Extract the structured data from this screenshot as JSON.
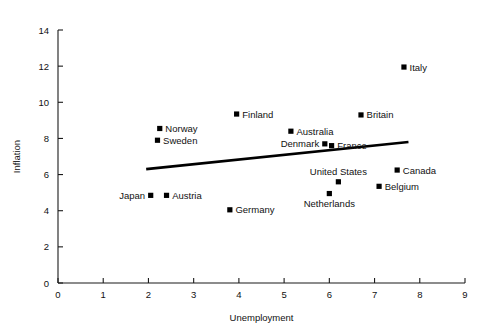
{
  "chart_data": {
    "type": "scatter",
    "title": "",
    "xlabel": "Unemployment",
    "ylabel": "Inflation",
    "xlim": [
      0,
      9
    ],
    "ylim": [
      0,
      14
    ],
    "xticks": [
      0,
      1,
      2,
      3,
      4,
      5,
      6,
      7,
      8,
      9
    ],
    "yticks": [
      0,
      2,
      4,
      6,
      8,
      10,
      12,
      14
    ],
    "grid": false,
    "legend": "none",
    "marker_style": "filled-square",
    "marker_color": "#000000",
    "points": [
      {
        "label": "Italy",
        "x": 7.65,
        "y": 11.95,
        "label_pos": "right"
      },
      {
        "label": "Britain",
        "x": 6.7,
        "y": 9.3,
        "label_pos": "right"
      },
      {
        "label": "Finland",
        "x": 3.95,
        "y": 9.35,
        "label_pos": "right"
      },
      {
        "label": "Norway",
        "x": 2.25,
        "y": 8.55,
        "label_pos": "right"
      },
      {
        "label": "Australia",
        "x": 5.15,
        "y": 8.4,
        "label_pos": "right"
      },
      {
        "label": "Sweden",
        "x": 2.2,
        "y": 7.9,
        "label_pos": "right"
      },
      {
        "label": "Denmark",
        "x": 5.9,
        "y": 7.7,
        "label_pos": "left"
      },
      {
        "label": "France",
        "x": 6.05,
        "y": 7.6,
        "label_pos": "right"
      },
      {
        "label": "Canada",
        "x": 7.5,
        "y": 6.25,
        "label_pos": "right"
      },
      {
        "label": "United States",
        "x": 6.2,
        "y": 5.6,
        "label_pos": "above"
      },
      {
        "label": "Belgium",
        "x": 7.1,
        "y": 5.35,
        "label_pos": "right"
      },
      {
        "label": "Netherlands",
        "x": 6.0,
        "y": 4.95,
        "label_pos": "below"
      },
      {
        "label": "Japan",
        "x": 2.05,
        "y": 4.85,
        "label_pos": "left"
      },
      {
        "label": "Austria",
        "x": 2.4,
        "y": 4.85,
        "label_pos": "right"
      },
      {
        "label": "Germany",
        "x": 3.8,
        "y": 4.05,
        "label_pos": "right"
      }
    ],
    "trend_line": {
      "type": "linear-fit",
      "x_start": 1.95,
      "y_start": 6.3,
      "x_end": 7.75,
      "y_end": 7.8
    }
  }
}
